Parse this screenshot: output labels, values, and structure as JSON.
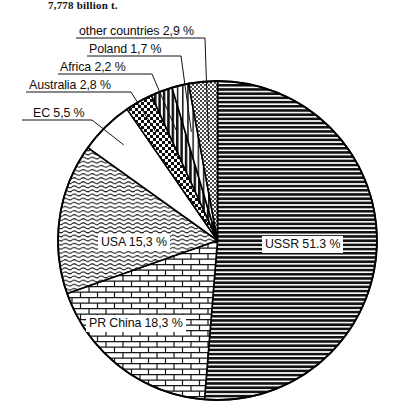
{
  "heading": "7,778 billion t.",
  "chart_data": {
    "type": "pie",
    "title": "7,778 billion t.",
    "unit": "%",
    "total_label": "7,778 billion t.",
    "start_angle_deg": 0,
    "direction": "clockwise",
    "legend": "none",
    "grid": false,
    "categories": [
      "USSR",
      "PR China",
      "USA",
      "EC",
      "Australia",
      "Africa",
      "Poland",
      "other countries"
    ],
    "values": [
      51.3,
      18.3,
      15.3,
      5.5,
      2.8,
      2.2,
      1.7,
      2.9
    ],
    "slices": [
      {
        "name": "USSR",
        "value": 51.3,
        "label": "USSR 51.3 %",
        "pattern": "horizontal-lines-dense",
        "label_position": "inside",
        "label_x": 262,
        "label_y": 236
      },
      {
        "name": "PR China",
        "value": 18.3,
        "label": "PR China 18,3 %",
        "pattern": "brick",
        "label_position": "inside",
        "label_x": 86,
        "label_y": 315
      },
      {
        "name": "USA",
        "value": 15.3,
        "label": "USA 15,3 %",
        "pattern": "wavy-lines-light",
        "label_position": "inside",
        "label_x": 98,
        "label_y": 234
      },
      {
        "name": "EC",
        "value": 5.5,
        "label": "EC 5,5 %",
        "pattern": "blank-white",
        "label_position": "callout",
        "label_x": 33,
        "label_y": 106
      },
      {
        "name": "Australia",
        "value": 2.8,
        "label": "Australia 2,8 %",
        "pattern": "checkerboard",
        "label_position": "callout",
        "label_x": 29,
        "label_y": 78
      },
      {
        "name": "Africa",
        "value": 2.2,
        "label": "Africa 2,2 %",
        "pattern": "vertical-lines-dense",
        "label_position": "callout",
        "label_x": 60,
        "label_y": 60
      },
      {
        "name": "Poland",
        "value": 1.7,
        "label": "Poland 1,7 %",
        "pattern": "vertical-lines-light",
        "label_position": "callout",
        "label_x": 89,
        "label_y": 42
      },
      {
        "name": "other countries",
        "value": 2.9,
        "label": "other countries 2,9 %",
        "pattern": "gray-stipple",
        "label_position": "callout",
        "label_x": 79,
        "label_y": 24
      }
    ],
    "colors": {
      "outline": "#000000",
      "background": "#ffffff",
      "text": "#100d0c"
    }
  }
}
